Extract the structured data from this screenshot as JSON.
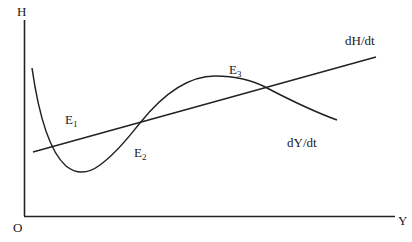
{
  "diagram": {
    "axes": {
      "y_axis_label": "H",
      "x_axis_label": "Y",
      "origin_label": "O"
    },
    "curves": [
      {
        "id": "dH_dt",
        "label": "dH/dt",
        "shape": "straight line, upward sloping"
      },
      {
        "id": "dY_dt",
        "label": "dY/dt",
        "shape": "cubic-like curve: falls, minimum, rises to maximum, falls"
      }
    ],
    "equilibria": [
      {
        "base": "E",
        "sub": "1"
      },
      {
        "base": "E",
        "sub": "2"
      },
      {
        "base": "E",
        "sub": "3"
      }
    ],
    "colors": {
      "line": "#222222",
      "background": "#ffffff"
    }
  }
}
